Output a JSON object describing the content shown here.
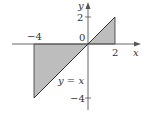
{
  "diagram": {
    "function_label": "y = x",
    "axes": {
      "x_label": "x",
      "y_label": "y"
    },
    "ticks": {
      "x_neg4": "−4",
      "x_0": "0",
      "x_2": "2",
      "y_2": "2",
      "y_neg4": "−4"
    },
    "shaded_interval": [
      -4,
      2
    ],
    "colors": {
      "shade": "#bdbdbd",
      "line": "#333333",
      "axis": "#555555"
    }
  }
}
